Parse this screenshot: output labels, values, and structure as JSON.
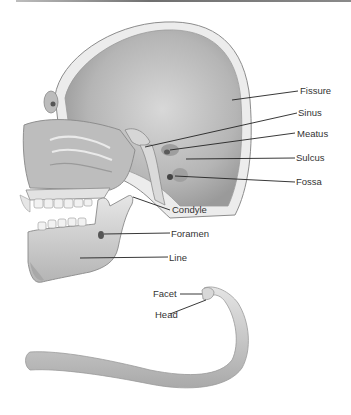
{
  "figure": {
    "labels": {
      "fissure": "Fissure",
      "sinus": "Sinus",
      "meatus": "Meatus",
      "sulcus": "Sulcus",
      "fossa": "Fossa",
      "condyle": "Condyle",
      "foramen": "Foramen",
      "line": "Line",
      "facet": "Facet",
      "head": "Head"
    }
  }
}
